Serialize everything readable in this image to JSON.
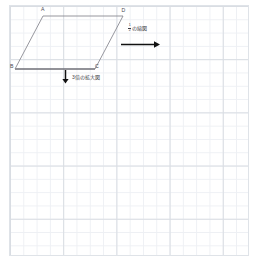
{
  "figure": {
    "type": "geometry-worksheet",
    "shape_name": "parallelogram",
    "vertices": [
      {
        "label": "A",
        "x": 43,
        "y": 16
      },
      {
        "label": "D",
        "x": 123,
        "y": 16
      },
      {
        "label": "C",
        "x": 95,
        "y": 69
      },
      {
        "label": "B",
        "x": 15,
        "y": 69
      }
    ],
    "vertex_labels": {
      "a": "A",
      "b": "B",
      "c": "C",
      "d": "D"
    },
    "stroke_color": "#8a8a92",
    "base_stroke_color": "#6e6e76"
  },
  "annotations": {
    "reduction": {
      "numerator": "1",
      "denominator": "2",
      "text": "の縮図",
      "arrow_direction": "right",
      "arrow_color": "#111111"
    },
    "enlargement": {
      "text": "3倍の拡大図",
      "arrow_direction": "down",
      "arrow_color": "#111111"
    }
  },
  "grid": {
    "cell_size": "13.3",
    "major_every": "4",
    "minor_line_color": "#eef0f4",
    "major_line_color": "#d9dde3",
    "background_color": "#ffffff"
  }
}
